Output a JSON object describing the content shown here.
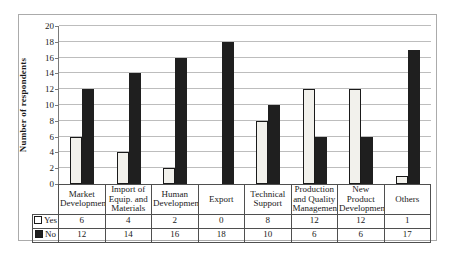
{
  "chart_data": {
    "type": "bar",
    "title": "",
    "xlabel": "",
    "ylabel": "Number of respondents",
    "ylim": [
      0,
      20
    ],
    "ytick_step": 2,
    "grid": true,
    "legend_position": "table-left-column",
    "categories": [
      "Market Development",
      "Import of Equip. and Materials",
      "Human Development",
      "Export",
      "Technical Support",
      "Production and Quality Management",
      "New Product Development",
      "Others"
    ],
    "series": [
      {
        "name": "Yes",
        "values": [
          6,
          4,
          2,
          0,
          8,
          12,
          12,
          1
        ]
      },
      {
        "name": "No",
        "values": [
          12,
          14,
          16,
          18,
          10,
          6,
          6,
          17
        ]
      }
    ]
  },
  "colors": {
    "yes_fill": "#f2f1ec",
    "yes_border": "#1a1a1a",
    "no_fill": "#1f1f1f",
    "gridline": "#bdbdbd",
    "axis": "#7a7a7a",
    "table_border": "#4f4f4f",
    "frame": "#ababab",
    "text": "#1a1a1a"
  }
}
